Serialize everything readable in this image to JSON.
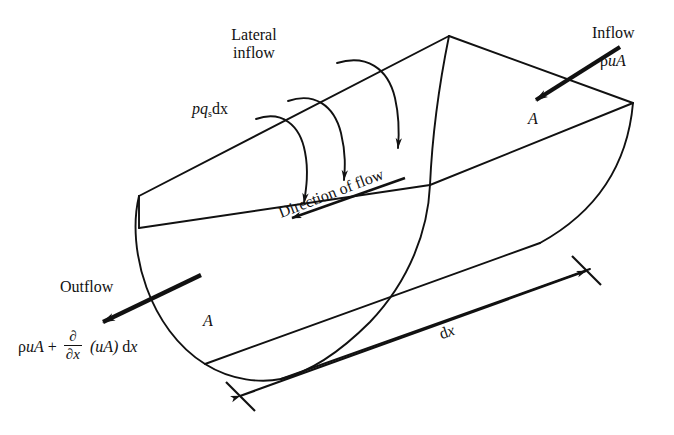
{
  "figure": {
    "background_color": "#ffffff",
    "line_color": "#111111"
  },
  "labels": {
    "lateral_inflow_line1": "Lateral",
    "lateral_inflow_line2": "inflow",
    "lateral_inflow_symbol_pre": "pq",
    "lateral_inflow_symbol_sub": "s",
    "lateral_inflow_symbol_post": "dx",
    "inflow": "Inflow",
    "inflow_rho": "ρ",
    "inflow_ua": "uA",
    "outflow": "Outflow",
    "area_right": "A",
    "area_left": "A",
    "direction_of_flow": "Direction of flow",
    "length_dx_d": "d",
    "length_dx_x": "x"
  },
  "outflow_equation": {
    "rho": "ρ",
    "ua": "uA",
    "plus": "+",
    "numerator": "∂",
    "denominator": "∂x",
    "grouped": "(uA)",
    "tail_d": "d",
    "tail_x": "x"
  },
  "geometry": {
    "far_apex_top": [
      449,
      36
    ],
    "far_left_top": [
      139,
      196
    ],
    "near_left_top": [
      139,
      228
    ],
    "near_bottom_curve_low": [
      279,
      380
    ],
    "right_outer_corner": [
      633,
      103
    ],
    "dx_arrow_start": [
      236,
      398
    ],
    "dx_arrow_end": [
      590,
      269
    ]
  }
}
